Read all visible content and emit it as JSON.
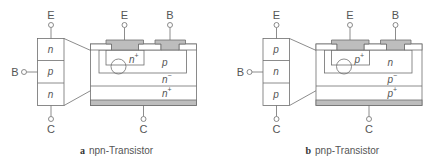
{
  "figure": {
    "colors": {
      "line": "#6e6e6e",
      "metal": "#bdbdbd",
      "oxide": "#ffffff",
      "text": "#555555"
    },
    "panels": [
      {
        "id": "a",
        "caption_letter": "a",
        "caption_text": "npn-Transistor",
        "stack": {
          "top_terminal": "E",
          "side_terminal": "B",
          "bottom_terminal": "C",
          "layers": [
            "n",
            "p",
            "n"
          ]
        },
        "device": {
          "emitter_label": "E",
          "base_label": "B",
          "collector_label": "C",
          "emitter_region": {
            "base": "n",
            "sup": "+"
          },
          "base_region": {
            "base": "p",
            "sup": ""
          },
          "drift_region": {
            "base": "n",
            "sup": "−"
          },
          "substrate_region": {
            "base": "n",
            "sup": "+"
          }
        }
      },
      {
        "id": "b",
        "caption_letter": "b",
        "caption_text": "pnp-Transistor",
        "stack": {
          "top_terminal": "E",
          "side_terminal": "B",
          "bottom_terminal": "C",
          "layers": [
            "p",
            "n",
            "p"
          ]
        },
        "device": {
          "emitter_label": "E",
          "base_label": "B",
          "collector_label": "C",
          "emitter_region": {
            "base": "p",
            "sup": "+"
          },
          "base_region": {
            "base": "n",
            "sup": ""
          },
          "drift_region": {
            "base": "p",
            "sup": "−"
          },
          "substrate_region": {
            "base": "p",
            "sup": "+"
          }
        }
      }
    ]
  }
}
